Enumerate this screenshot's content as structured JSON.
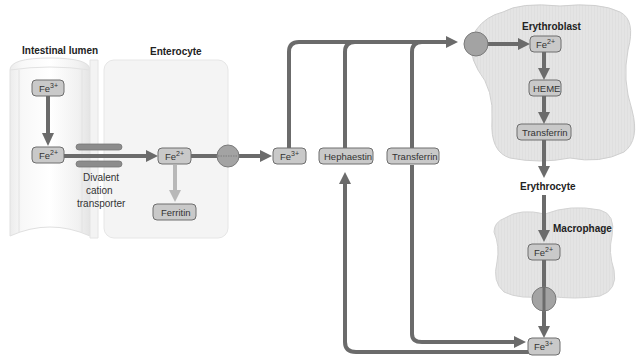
{
  "labels": {
    "intestinal_lumen": "Intestinal lumen",
    "enterocyte": "Enterocyte",
    "erythroblast": "Erythroblast",
    "erythrocyte": "Erythrocyte",
    "macrophage": "Macrophage",
    "transporter_line1": "Divalent",
    "transporter_line2": "cation",
    "transporter_line3": "transporter"
  },
  "nodes": {
    "lumen_fe3": {
      "base": "Fe",
      "sup": "3+"
    },
    "lumen_fe2": {
      "base": "Fe",
      "sup": "2+"
    },
    "enterocyte_fe2": {
      "base": "Fe",
      "sup": "2+"
    },
    "ferritin": {
      "text": "Ferritin"
    },
    "plasma_fe3": {
      "base": "Fe",
      "sup": "3+"
    },
    "hephaestin": {
      "text": "Hephaestin"
    },
    "transferrin_plasma": {
      "text": "Transferrin"
    },
    "erythroblast_fe2": {
      "base": "Fe",
      "sup": "2+"
    },
    "heme": {
      "text": "HEME"
    },
    "transferrin_erythroblast": {
      "text": "Transferrin"
    },
    "macrophage_fe2": {
      "base": "Fe",
      "sup": "2+"
    },
    "macrophage_fe3": {
      "base": "Fe",
      "sup": "3+"
    }
  },
  "colors": {
    "arrow": "#6b6b6b",
    "arrow_light": "#b8b8b8",
    "box_fill": "#c9c9c9",
    "cell_fill": "#e6e6e6"
  }
}
